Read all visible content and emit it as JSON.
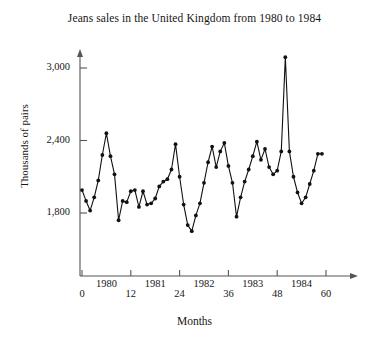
{
  "chart_data": {
    "type": "line",
    "title": "Jeans sales in the United Kingdom from 1980 to 1984",
    "xlabel": "Months",
    "ylabel": "Thousands of pairs",
    "xlim": [
      -2,
      62
    ],
    "ylim": [
      1550,
      3200
    ],
    "grid": false,
    "legend": null,
    "markers": "filled-circle",
    "line_color": "#111111",
    "axis_color": "#555555",
    "yticks": [
      1800,
      2400,
      3000
    ],
    "ytick_labels": [
      "1,800",
      "2,400",
      "3,000"
    ],
    "xticks": [
      0,
      12,
      24,
      36,
      48,
      60
    ],
    "xtick_labels": [
      "0",
      "12",
      "24",
      "36",
      "48",
      "60"
    ],
    "year_labels": [
      {
        "label": "1980",
        "x": 6
      },
      {
        "label": "1981",
        "x": 18
      },
      {
        "label": "1982",
        "x": 30
      },
      {
        "label": "1983",
        "x": 42
      },
      {
        "label": "1984",
        "x": 54
      }
    ],
    "series": [
      {
        "name": "Jeans sales",
        "x": [
          0,
          1,
          2,
          3,
          4,
          5,
          6,
          7,
          8,
          9,
          10,
          11,
          12,
          13,
          14,
          15,
          16,
          17,
          18,
          19,
          20,
          21,
          22,
          23,
          24,
          25,
          26,
          27,
          28,
          29,
          30,
          31,
          32,
          33,
          34,
          35,
          36,
          37,
          38,
          39,
          40,
          41,
          42,
          43,
          44,
          45,
          46,
          47,
          48,
          49,
          50,
          51,
          52,
          53,
          54,
          55,
          56,
          57,
          58,
          59
        ],
        "values": [
          1990,
          1900,
          1820,
          1930,
          2070,
          2280,
          2460,
          2270,
          2120,
          1740,
          1900,
          1890,
          1980,
          1990,
          1850,
          1980,
          1870,
          1880,
          1920,
          2020,
          2060,
          2080,
          2160,
          2370,
          2100,
          1870,
          1700,
          1650,
          1780,
          1880,
          2050,
          2220,
          2350,
          2180,
          2310,
          2380,
          2190,
          2050,
          1770,
          1930,
          2060,
          2160,
          2270,
          2390,
          2240,
          2330,
          2180,
          2120,
          2150,
          2310,
          3090,
          2310,
          2100,
          1970,
          1880,
          1930,
          2040,
          2150,
          2290,
          2290
        ]
      }
    ]
  }
}
